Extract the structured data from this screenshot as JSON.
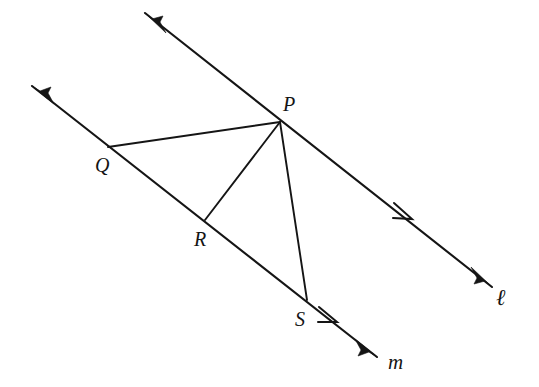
{
  "figure": {
    "kind": "geometry-diagram",
    "width": 539,
    "height": 387,
    "background_color": "#ffffff",
    "ink_color": "#151515"
  },
  "lines": [
    {
      "id": "line-l",
      "label": "ℓ",
      "label_x": 496,
      "label_y": 286,
      "start": {
        "x": 145,
        "y": 13
      },
      "end": {
        "x": 492,
        "y": 287
      },
      "start_arrow": true,
      "end_arrow": true,
      "direction_mark": {
        "x": 408,
        "y": 215,
        "count": 1
      }
    },
    {
      "id": "line-m",
      "label": "m",
      "label_x": 388,
      "label_y": 352,
      "start": {
        "x": 32,
        "y": 86
      },
      "end": {
        "x": 377,
        "y": 357
      },
      "start_arrow": true,
      "end_arrow": true,
      "direction_mark": {
        "x": 332,
        "y": 318,
        "count": 1
      }
    }
  ],
  "points": [
    {
      "id": "point-p",
      "label": "P",
      "x": 280,
      "y": 122,
      "label_x": 283,
      "label_y": 94,
      "on_line": "line-l"
    },
    {
      "id": "point-q",
      "label": "Q",
      "x": 108,
      "y": 147,
      "label_x": 95,
      "label_y": 155,
      "on_line": "line-m"
    },
    {
      "id": "point-r",
      "label": "R",
      "x": 205,
      "y": 220,
      "label_x": 194,
      "label_y": 229,
      "on_line": "line-m"
    },
    {
      "id": "point-s",
      "label": "S",
      "x": 307,
      "y": 300,
      "label_x": 295,
      "label_y": 309,
      "on_line": "line-m"
    }
  ],
  "segments": [
    {
      "id": "segment-pq",
      "label": "PQ",
      "from": "point-p",
      "to": "point-q",
      "x1": 280,
      "y1": 122,
      "x2": 108,
      "y2": 147
    },
    {
      "id": "segment-pr",
      "label": "PR",
      "from": "point-p",
      "to": "point-r",
      "x1": 280,
      "y1": 122,
      "x2": 205,
      "y2": 220
    },
    {
      "id": "segment-ps",
      "label": "PS",
      "from": "point-p",
      "to": "point-s",
      "x1": 280,
      "y1": 122,
      "x2": 307,
      "y2": 300
    }
  ]
}
